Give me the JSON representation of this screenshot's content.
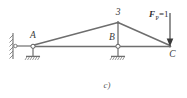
{
  "figure": {
    "caption": "c)",
    "type": "truss-diagram",
    "line_color": "#6e6e6e",
    "label_color": "#3a3a3a",
    "background": "#ffffff"
  },
  "nodes": [
    {
      "id": "A",
      "label": "A",
      "x": 33,
      "y": 46
    },
    {
      "id": "B",
      "label": "B",
      "x": 118,
      "y": 46
    },
    {
      "id": "3",
      "label": "3",
      "x": 118,
      "y": 22
    },
    {
      "id": "C",
      "label": "C",
      "x": 170,
      "y": 46
    }
  ],
  "load": {
    "label": "F",
    "subscript": "P",
    "equals": "=1",
    "full_text": "FP=1",
    "direction": "down",
    "applied_at": "C",
    "x": 170,
    "y_start": 18,
    "y_end": 45
  },
  "supports": [
    {
      "at": "A",
      "kind": "pin-on-rollers",
      "wall": "left-vertical-hatched"
    },
    {
      "at": "B",
      "kind": "pin-on-rollers"
    }
  ],
  "members": [
    {
      "from": "A",
      "to": "3"
    },
    {
      "from": "3",
      "to": "C"
    },
    {
      "from": "A",
      "to": "B"
    },
    {
      "from": "B",
      "to": "C"
    },
    {
      "from": "3",
      "to": "B"
    }
  ]
}
